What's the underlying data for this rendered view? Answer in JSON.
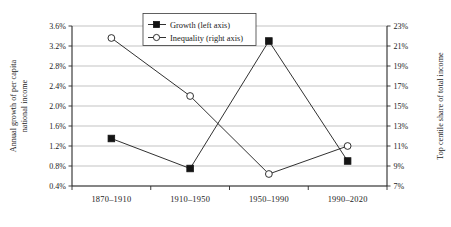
{
  "chart_data": {
    "type": "line",
    "title": "",
    "categories": [
      "1870–1910",
      "1910–1950",
      "1950–1990",
      "1990–2020"
    ],
    "series": [
      {
        "name": "Growth (left axis)",
        "axis": "left",
        "marker": "filled-square",
        "values": [
          1.35,
          0.75,
          3.3,
          0.9
        ]
      },
      {
        "name": "Inequality (right axis)",
        "axis": "right",
        "marker": "open-circle",
        "values": [
          21.8,
          16.0,
          8.2,
          11.0
        ]
      }
    ],
    "xlabel": "",
    "ylabel": "Annual growth of per capita national income",
    "y2label": "Top centile share of total income",
    "ylim": [
      0.4,
      3.6
    ],
    "y2lim": [
      7,
      23
    ],
    "ytick_labels": [
      "3.6%",
      "3.2%",
      "2.8%",
      "2.4%",
      "2.0%",
      "1.6%",
      "1.2%",
      "0.8%",
      "0.4%"
    ],
    "ytick_values": [
      3.6,
      3.2,
      2.8,
      2.4,
      2.0,
      1.6,
      1.2,
      0.8,
      0.4
    ],
    "y2tick_labels": [
      "23%",
      "21%",
      "19%",
      "17%",
      "15%",
      "13%",
      "11%",
      "9%",
      "7%"
    ],
    "y2tick_values": [
      23,
      21,
      19,
      17,
      15,
      13,
      11,
      9,
      7
    ],
    "grid": true,
    "legend_position": "top-center"
  },
  "axis_titles": {
    "left_line1": "Annual growth of per capita",
    "left_line2": "national income",
    "right": "Top centile share of total income"
  },
  "legend": {
    "entries": [
      {
        "label": "Growth (left axis)"
      },
      {
        "label": "Inequality (right axis)"
      }
    ]
  },
  "y_axis_left": {
    "labels": [
      "3.6%",
      "3.2%",
      "2.8%",
      "2.4%",
      "2.0%",
      "1.6%",
      "1.2%",
      "0.8%",
      "0.4%"
    ]
  },
  "y_axis_right": {
    "labels": [
      "23%",
      "21%",
      "19%",
      "17%",
      "15%",
      "13%",
      "11%",
      "9%",
      "7%"
    ]
  },
  "x_axis": {
    "labels": [
      "1870–1910",
      "1910–1950",
      "1950–1990",
      "1990–2020"
    ]
  },
  "colors": {
    "line": "#1a1a1a",
    "grid": "#9a9a9a",
    "axis": "#2a2a2a",
    "background": "#ffffff"
  }
}
